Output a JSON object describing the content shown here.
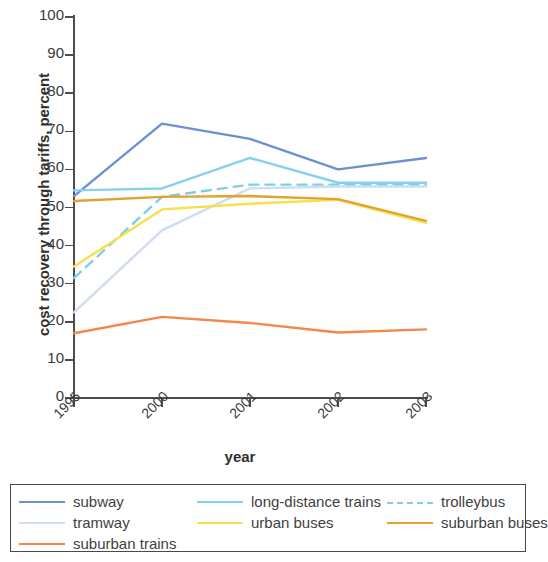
{
  "chart_data": {
    "type": "line",
    "title": "",
    "xlabel": "year",
    "ylabel": "cost recovery through tariffs, percent",
    "categories": [
      "1995",
      "2000",
      "2001",
      "2002",
      "2003"
    ],
    "ylim": [
      0,
      100
    ],
    "yticks": [
      0,
      10,
      20,
      30,
      40,
      50,
      60,
      70,
      80,
      90,
      100
    ],
    "grid": false,
    "legend_position": "bottom",
    "series": [
      {
        "name": "subway",
        "color": "#6e8fd0",
        "style": "solid",
        "values": [
          53.0,
          72.0,
          68.0,
          60.0,
          63.0
        ]
      },
      {
        "name": "long-distance trains",
        "color": "#86d2ec",
        "style": "solid",
        "values": [
          54.5,
          55.0,
          63.0,
          56.5,
          56.5
        ]
      },
      {
        "name": "trolleybus",
        "color": "#7fcfe4",
        "style": "dashed",
        "values": [
          31.5,
          52.8,
          56.0,
          56.0,
          56.0
        ]
      },
      {
        "name": "tramway",
        "color": "#cfdcf2",
        "style": "solid",
        "values": [
          22.5,
          44.0,
          55.0,
          55.5,
          55.5
        ]
      },
      {
        "name": "urban buses",
        "color": "#f7e04a",
        "style": "solid",
        "values": [
          34.5,
          49.5,
          51.0,
          52.0,
          46.0
        ]
      },
      {
        "name": "suburban buses",
        "color": "#e0a32e",
        "style": "solid",
        "values": [
          51.7,
          52.8,
          53.0,
          52.2,
          46.5
        ]
      },
      {
        "name": "suburban trains",
        "color": "#f4884c",
        "style": "solid",
        "values": [
          17.0,
          21.3,
          19.7,
          17.2,
          18.0
        ]
      }
    ]
  },
  "legend": {
    "rows": [
      [
        {
          "label": "subway",
          "series": 0
        },
        {
          "label": "long-distance trains",
          "series": 1
        },
        {
          "label": "trolleybus",
          "series": 2
        }
      ],
      [
        {
          "label": "tramway",
          "series": 3
        },
        {
          "label": "urban buses",
          "series": 4
        },
        {
          "label": "suburban buses",
          "series": 5
        }
      ],
      [
        {
          "label": "suburban trains",
          "series": 6
        }
      ]
    ]
  }
}
